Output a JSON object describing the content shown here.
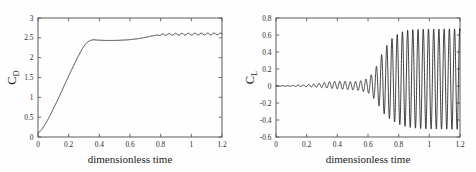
{
  "figure": {
    "background_color": "#fefefe",
    "axis_color": "#5a5a5a",
    "curve_color": "#111111",
    "panel_count": 2
  },
  "chart_data": [
    {
      "type": "line",
      "id": "drag-coefficient-plot",
      "title": "",
      "xlabel": "dimensionless time",
      "ylabel": "C_D",
      "ylabel_base": "C",
      "ylabel_sub": "D",
      "xlim": [
        0,
        1.2
      ],
      "ylim": [
        0,
        3
      ],
      "xticks": [
        0,
        0.2,
        0.4,
        0.6,
        0.8,
        1,
        1.2
      ],
      "xticklabels": [
        "0",
        "0.2",
        "0.4",
        "0.6",
        "0.8",
        "1",
        "1.2"
      ],
      "yticks": [
        0,
        0.5,
        1,
        1.5,
        2,
        2.5,
        3
      ],
      "yticklabels": [
        "0",
        "0.5",
        "1",
        "1.5",
        "2",
        "2.5",
        "3"
      ],
      "grid": false,
      "legend": "none",
      "series": [
        {
          "name": "C_D",
          "x": [
            0,
            0.01,
            0.02,
            0.03,
            0.04,
            0.05,
            0.06,
            0.07,
            0.08,
            0.09,
            0.1,
            0.11,
            0.12,
            0.13,
            0.14,
            0.15,
            0.16,
            0.17,
            0.18,
            0.19,
            0.2,
            0.21,
            0.22,
            0.23,
            0.24,
            0.25,
            0.26,
            0.27,
            0.28,
            0.29,
            0.3,
            0.31,
            0.32,
            0.33,
            0.34,
            0.35,
            0.36,
            0.37,
            0.375,
            0.38,
            0.4,
            0.42,
            0.44,
            0.46,
            0.48,
            0.5,
            0.52,
            0.54,
            0.56,
            0.58,
            0.6,
            0.62,
            0.64,
            0.66,
            0.68,
            0.7,
            0.72,
            0.74,
            0.76,
            0.78,
            0.8,
            0.82,
            0.84,
            0.86,
            0.88,
            0.9,
            0.92,
            0.94,
            0.96,
            0.98,
            1.0,
            1.02,
            1.04,
            1.06,
            1.08,
            1.1,
            1.12,
            1.14,
            1.16,
            1.18,
            1.2
          ],
          "values": [
            0.1,
            0.13,
            0.17,
            0.22,
            0.28,
            0.34,
            0.41,
            0.48,
            0.55,
            0.63,
            0.71,
            0.79,
            0.87,
            0.95,
            1.03,
            1.12,
            1.2,
            1.29,
            1.37,
            1.45,
            1.54,
            1.62,
            1.7,
            1.78,
            1.86,
            1.94,
            2.02,
            2.09,
            2.16,
            2.23,
            2.29,
            2.34,
            2.38,
            2.41,
            2.43,
            2.445,
            2.45,
            2.45,
            2.448,
            2.445,
            2.44,
            2.437,
            2.435,
            2.434,
            2.434,
            2.435,
            2.437,
            2.44,
            2.444,
            2.449,
            2.455,
            2.463,
            2.472,
            2.483,
            2.496,
            2.511,
            2.527,
            2.543,
            2.557,
            2.568,
            2.576,
            2.581,
            2.585,
            2.587,
            2.589,
            2.59,
            2.591,
            2.592,
            2.592,
            2.593,
            2.593,
            2.594,
            2.594,
            2.595,
            2.595,
            2.596,
            2.596,
            2.597,
            2.597,
            2.598,
            2.598
          ]
        }
      ],
      "oscillation": {
        "start_x": 0.76,
        "end_x": 1.2,
        "amplitude": 0.022,
        "period": 0.042,
        "description": "small ripples superimposed on the drag plateau"
      },
      "annotations": [
        {
          "text": "rapid rise from 0.1 to 2.45 between t=0 and t=0.37"
        },
        {
          "text": "plateau near 2.44 between t=0.37 and t=0.65"
        },
        {
          "text": "secondary rise to about 2.6 with small oscillations after t=0.75"
        }
      ]
    },
    {
      "type": "line",
      "id": "lift-coefficient-plot",
      "title": "",
      "xlabel": "dimensionless time",
      "ylabel": "C_L",
      "ylabel_base": "C",
      "ylabel_sub": "L",
      "xlim": [
        0,
        1.2
      ],
      "ylim": [
        -0.6,
        0.8
      ],
      "xticks": [
        0,
        0.2,
        0.4,
        0.6,
        0.8,
        1,
        1.2
      ],
      "xticklabels": [
        "0",
        "0.2",
        "0.4",
        "0.6",
        "0.8",
        "1",
        "1.2"
      ],
      "yticks": [
        -0.6,
        -0.4,
        -0.2,
        0,
        0.2,
        0.4,
        0.6,
        0.8
      ],
      "yticklabels": [
        "-0.6",
        "-0.4",
        "-0.2",
        "0",
        "0.2",
        "0.4",
        "0.6",
        "0.8"
      ],
      "grid": false,
      "legend": "none",
      "series": [
        {
          "name": "C_L",
          "x": [
            0,
            0.05,
            0.1,
            0.15,
            0.2,
            0.25,
            0.3,
            0.35,
            0.4,
            0.45,
            0.5,
            0.55,
            0.6,
            0.62,
            0.64,
            0.66,
            0.68,
            0.7,
            0.75,
            0.8,
            0.85,
            0.9,
            0.95,
            1.0,
            1.05,
            1.1,
            1.15,
            1.2
          ],
          "values": [
            0.0,
            0.002,
            0.004,
            0.007,
            0.012,
            0.02,
            0.03,
            0.042,
            0.05,
            0.048,
            0.04,
            0.03,
            0.02,
            0.03,
            0.02,
            0.04,
            0.03,
            0.05,
            0.06,
            0.06,
            0.07,
            0.07,
            0.07,
            0.07,
            0.07,
            0.07,
            0.07,
            0.07
          ],
          "envelope_upper": [
            0.002,
            0.004,
            0.006,
            0.01,
            0.016,
            0.024,
            0.036,
            0.05,
            0.056,
            0.055,
            0.05,
            0.06,
            0.09,
            0.13,
            0.18,
            0.25,
            0.33,
            0.42,
            0.55,
            0.62,
            0.655,
            0.665,
            0.668,
            0.67,
            0.67,
            0.672,
            0.672,
            0.672
          ],
          "envelope_lower": [
            -0.002,
            -0.003,
            -0.004,
            -0.006,
            -0.008,
            -0.012,
            -0.018,
            -0.026,
            -0.034,
            -0.04,
            -0.045,
            -0.055,
            -0.08,
            -0.11,
            -0.15,
            -0.2,
            -0.26,
            -0.32,
            -0.4,
            -0.45,
            -0.48,
            -0.495,
            -0.502,
            -0.505,
            -0.507,
            -0.508,
            -0.509,
            -0.51
          ]
        }
      ],
      "oscillation": {
        "start_x": 0.55,
        "end_x": 1.2,
        "period": 0.034,
        "max_upper": 0.672,
        "max_lower": -0.51,
        "description": "vortex shedding oscillations grow from near zero and saturate with upper peaks near 0.67 and lower peaks near -0.51"
      },
      "annotations": [
        {
          "text": "lift stays near zero until t approximately 0.55"
        },
        {
          "text": "oscillation amplitude grows rapidly between t=0.6 and t=0.85"
        },
        {
          "text": "saturated oscillation band spans about -0.51 to 0.67"
        }
      ]
    }
  ]
}
